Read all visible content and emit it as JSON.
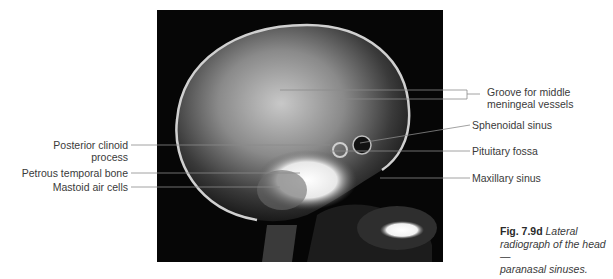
{
  "figure": {
    "image_alt": "Lateral radiograph of the head",
    "caption": {
      "number": "Fig. 7.9d",
      "text_lines": [
        "Lateral",
        "radiograph of the head —",
        "paranasal sinuses."
      ]
    }
  },
  "labels": {
    "left": [
      {
        "id": "posterior-clinoid-process",
        "lines": [
          "Posterior clinoid",
          "process"
        ]
      },
      {
        "id": "petrous-temporal-bone",
        "lines": [
          "Petrous temporal bone"
        ]
      },
      {
        "id": "mastoid-air-cells",
        "lines": [
          "Mastoid air cells"
        ]
      }
    ],
    "right": [
      {
        "id": "groove-middle-meningeal",
        "lines": [
          "Groove for middle",
          "meningeal vessels"
        ]
      },
      {
        "id": "sphenoidal-sinus",
        "lines": [
          "Sphenoidal sinus"
        ]
      },
      {
        "id": "pituitary-fossa",
        "lines": [
          "Pituitary fossa"
        ]
      },
      {
        "id": "maxillary-sinus",
        "lines": [
          "Maxillary sinus"
        ]
      }
    ]
  }
}
